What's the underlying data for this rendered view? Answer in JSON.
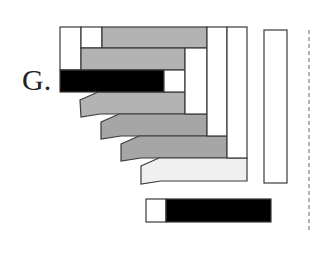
{
  "figure": {
    "label": "G.",
    "colors": {
      "outline": "#3a3a3a",
      "white": "#ffffff",
      "gray": "#b3b3b3",
      "dark_gray": "#a6a6a6",
      "light": "#f0f0f0",
      "black": "#000000",
      "dashed": "#9a9a9a"
    },
    "blocks": [
      {
        "name": "top-left-white-cell",
        "x": 60,
        "y": 27,
        "w": 21,
        "h": 43,
        "fill": "white"
      },
      {
        "name": "top-second-white-cell",
        "x": 81,
        "y": 27,
        "w": 21,
        "h": 21,
        "fill": "white"
      },
      {
        "name": "top-gray-bar",
        "x": 102,
        "y": 27,
        "w": 105,
        "h": 21,
        "fill": "gray"
      },
      {
        "name": "second-gray-bar",
        "x": 81,
        "y": 48,
        "w": 104,
        "h": 22,
        "fill": "gray"
      },
      {
        "name": "black-bar",
        "x": 60,
        "y": 70,
        "w": 104,
        "h": 22,
        "fill": "black"
      },
      {
        "name": "black-bar-white-cap",
        "x": 164,
        "y": 70,
        "w": 21,
        "h": 22,
        "fill": "white"
      },
      {
        "name": "white-column-1",
        "x": 185,
        "y": 48,
        "w": 22,
        "h": 66,
        "fill": "white"
      },
      {
        "name": "white-column-2",
        "x": 207,
        "y": 27,
        "w": 20,
        "h": 109,
        "fill": "white"
      },
      {
        "name": "white-column-3",
        "x": 227,
        "y": 27,
        "w": 20,
        "h": 131,
        "fill": "white"
      },
      {
        "name": "right-tall-white-bar",
        "x": 264,
        "y": 30,
        "w": 23,
        "h": 153,
        "fill": "white"
      },
      {
        "name": "bottom-white-cell",
        "x": 146,
        "y": 199,
        "w": 20,
        "h": 23,
        "fill": "white"
      },
      {
        "name": "bottom-black-bar",
        "x": 166,
        "y": 199,
        "w": 105,
        "h": 23,
        "fill": "black"
      }
    ],
    "slanted_bars": [
      {
        "name": "slanted-gray-bar-1",
        "points": "80,100 98,92 185,92 185,114 100,114 81,117",
        "fill": "gray"
      },
      {
        "name": "slanted-gray-bar-2",
        "points": "101,122 119,114 207,114 207,136 121,136 101,139",
        "fill": "dark_gray"
      },
      {
        "name": "slanted-gray-bar-3",
        "points": "121,144 139,136 227,136 227,158 141,158 121,161",
        "fill": "dark_gray"
      },
      {
        "name": "slanted-light-bar",
        "points": "141,166 159,158 247,158 247,181 161,181 141,184",
        "fill": "light"
      }
    ],
    "dashed_line": {
      "x": 309,
      "y1": 30,
      "y2": 230
    }
  }
}
